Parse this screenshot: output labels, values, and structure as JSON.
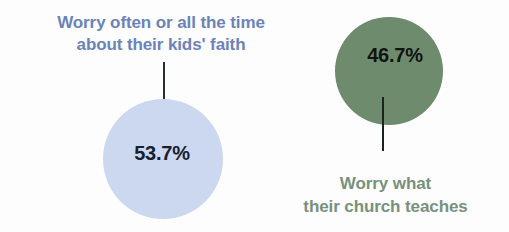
{
  "chart_data": {
    "type": "bar",
    "title": "",
    "subtitle": "",
    "xlabel": "",
    "ylabel": "",
    "categories": [
      "Worry often or all the time about their kids' faith",
      "Worry what their church teaches"
    ],
    "values": [
      53.7,
      46.7
    ],
    "value_labels": [
      "53.7%",
      "46.7%"
    ],
    "units": "percent",
    "legend": "none",
    "grid": false
  },
  "background_color": "#fdfdfd",
  "items": [
    {
      "id": "worry-kids-faith",
      "value": 53.7,
      "value_label": "53.7%",
      "label_line_1": "Worry often or all the time",
      "label_line_2": "about their kids' faith",
      "label_position": "above",
      "circle_color": "#ccd8f0",
      "label_color": "#6b83b8",
      "value_color": "#16202e",
      "leader_color": "#27303c"
    },
    {
      "id": "worry-church-teaches",
      "value": 46.7,
      "value_label": "46.7%",
      "label_line_1": "Worry what",
      "label_line_2": "their church teaches",
      "label_position": "below",
      "circle_color": "#6e8b6e",
      "label_color": "#77917c",
      "value_color": "#10140f",
      "leader_color": "#1c231c"
    }
  ]
}
